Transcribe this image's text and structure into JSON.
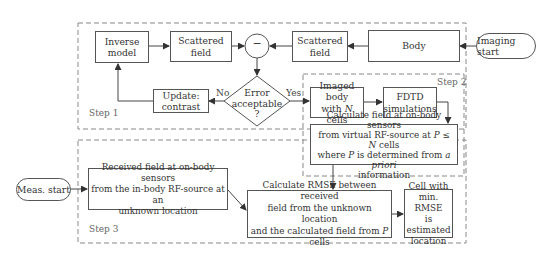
{
  "diagram": {
    "steps": {
      "step1": "Step 1",
      "step2": "Step 2",
      "step3": "Step 3"
    },
    "nodes": {
      "inverse_model": [
        "Inverse",
        "model"
      ],
      "scattered_field_left": [
        "Scattered",
        "field"
      ],
      "subtract": "−",
      "scattered_field_right": [
        "Scattered",
        "field"
      ],
      "body": "Body",
      "imaging_start": "Imaging start",
      "error_decision": [
        "Error",
        "acceptable",
        "?"
      ],
      "update_contrast": [
        "Update:",
        "contrast"
      ],
      "imaged_body": [
        "Imaged body",
        "with ",
        "N",
        " cells"
      ],
      "fdtd": [
        "FDTD",
        "simulations"
      ],
      "calc_field": {
        "line1": "Calculate field at on-body sensors",
        "line2a": "from virtual RF-source at ",
        "line2b": "P",
        "line2c": " ≤ ",
        "line2d": "N",
        "line2e": " cells",
        "line3a": "where ",
        "line3b": "P",
        "line3c": " is determined from ",
        "line3d": "a priori",
        "line4": "information"
      },
      "meas_start": "Meas. start",
      "received_field": [
        "Received field at on-body sensors",
        "from the in-body RF-source at an",
        "unknown location"
      ],
      "rmse": {
        "line1": "Calculate RMSE between received",
        "line2": "field from the unknown location",
        "line3a": "and the calculated field from ",
        "line3b": "P",
        "line3c": " cells"
      },
      "min_rmse_cell": [
        "Cell with",
        "min. RMSE",
        "is estimated",
        "location"
      ]
    },
    "edge_labels": {
      "no": "No",
      "yes": "Yes"
    },
    "colors": {
      "line": "#444444",
      "dashed": "#888888",
      "text": "#333333"
    }
  }
}
